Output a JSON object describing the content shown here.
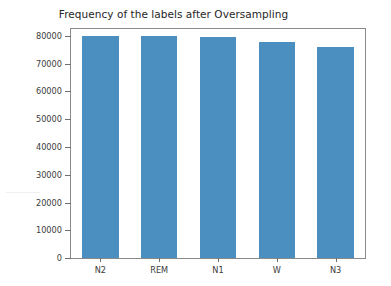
{
  "chart_data": {
    "type": "bar",
    "title": "Frequency of the labels after Oversampling",
    "xlabel": "",
    "ylabel": "",
    "categories": [
      "N2",
      "REM",
      "N1",
      "W",
      "N3"
    ],
    "values": [
      80000,
      80000,
      79500,
      78000,
      76000
    ],
    "series": [
      {
        "name": "Frequency",
        "values": [
          80000,
          80000,
          79500,
          78000,
          76000
        ],
        "color": "#4A8FC0"
      }
    ],
    "ylim": [
      0,
      82500
    ],
    "yticks": [
      0,
      10000,
      20000,
      30000,
      40000,
      50000,
      60000,
      70000,
      80000
    ],
    "ytick_labels": [
      "0",
      "10000",
      "20000",
      "30000",
      "40000",
      "50000",
      "60000",
      "70000",
      "80000"
    ],
    "xtick_labels": [
      "N2",
      "REM",
      "N1",
      "W",
      "N3"
    ],
    "grid": false,
    "legend": null,
    "legend_position": "none",
    "bar_color": "#4A8FC0",
    "frame_color": "#8a8a8a",
    "background_color": "#ffffff",
    "bar_width_fraction": 0.62,
    "annotations": []
  }
}
